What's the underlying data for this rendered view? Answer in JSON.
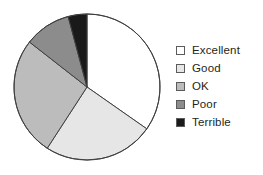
{
  "chart_data": {
    "type": "pie",
    "title": "",
    "categories": [
      "Excellent",
      "Good",
      "OK",
      "Poor",
      "Terrible"
    ],
    "values": [
      34.7,
      24.4,
      26.4,
      10.3,
      4.2
    ],
    "units": "percent",
    "start_angle_deg": 0,
    "direction": "clockwise",
    "boundary_angles_deg": [
      0,
      125,
      213,
      308,
      345,
      360
    ],
    "slice_colors": [
      "#ffffff",
      "#e6e6e6",
      "#bcbcbc",
      "#8c8c8c",
      "#1a1a1a"
    ],
    "slice_edge_color": "#404040",
    "legend_position": "right",
    "grid": false,
    "xlabel": "",
    "ylabel": "",
    "slices": [
      {
        "label": "Excellent",
        "value": 34.7,
        "color": "#ffffff",
        "start_deg": 0,
        "end_deg": 125
      },
      {
        "label": "Good",
        "value": 24.4,
        "color": "#e6e6e6",
        "start_deg": 125,
        "end_deg": 213
      },
      {
        "label": "OK",
        "value": 26.4,
        "color": "#bcbcbc",
        "start_deg": 213,
        "end_deg": 308
      },
      {
        "label": "Poor",
        "value": 10.3,
        "color": "#8c8c8c",
        "start_deg": 308,
        "end_deg": 345
      },
      {
        "label": "Terrible",
        "value": 4.2,
        "color": "#1a1a1a",
        "start_deg": 345,
        "end_deg": 360
      }
    ]
  },
  "legend": {
    "items": [
      {
        "label": "Excellent",
        "color": "#ffffff",
        "swatch_name": "legend-swatch-excellent"
      },
      {
        "label": "Good",
        "color": "#e6e6e6",
        "swatch_name": "legend-swatch-good"
      },
      {
        "label": "OK",
        "color": "#bcbcbc",
        "swatch_name": "legend-swatch-ok"
      },
      {
        "label": "Poor",
        "color": "#8c8c8c",
        "swatch_name": "legend-swatch-poor"
      },
      {
        "label": "Terrible",
        "color": "#1a1a1a",
        "swatch_name": "legend-swatch-terrible"
      }
    ]
  },
  "geometry": {
    "center_x": 74,
    "center_y": 74,
    "radius": 73
  }
}
